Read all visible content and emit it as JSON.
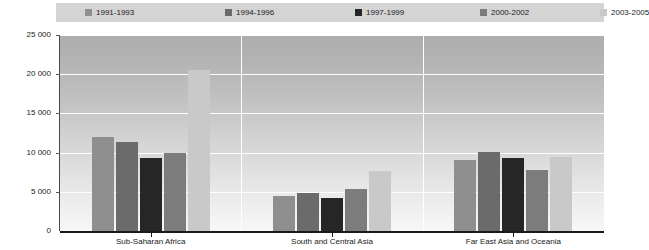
{
  "chart_data": {
    "type": "bar",
    "title": "",
    "subtitle": "",
    "xlabel": "",
    "ylabel": "",
    "ylim": [
      0,
      25000
    ],
    "ytick_labels": [
      "0",
      "5 000",
      "10 000",
      "15 000",
      "20 000",
      "25 000"
    ],
    "ytick_values": [
      0,
      5000,
      10000,
      15000,
      20000,
      25000
    ],
    "grid": true,
    "legend_position": "top",
    "categories": [
      "Sub-Saharan Africa",
      "South and Central Asia",
      "Far East Asia and Oceania"
    ],
    "series": [
      {
        "name": "1991-1993",
        "color": "#8f8f8f",
        "values": [
          12000,
          4500,
          9100
        ]
      },
      {
        "name": "1994-1996",
        "color": "#6b6b6b",
        "values": [
          11400,
          4900,
          10100
        ]
      },
      {
        "name": "1997-1999",
        "color": "#262626",
        "values": [
          9300,
          4200,
          9300
        ]
      },
      {
        "name": "2000-2002",
        "color": "#7c7c7c",
        "values": [
          10000,
          5300,
          7800
        ]
      },
      {
        "name": "2003-2005",
        "color": "#c9c9c9",
        "values": [
          20500,
          7700,
          9500
        ]
      }
    ]
  },
  "colors": {
    "legend_background": "#d4d4d4",
    "axis": "#1a1a1a",
    "gridline": "#ffffff",
    "plot_bg_top": "#adadad",
    "plot_bg_bottom": "#f7f7f7"
  }
}
